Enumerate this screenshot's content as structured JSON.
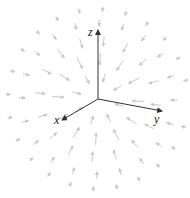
{
  "diagram": {
    "type": "3d-vector-field",
    "origin": [
      98,
      99
    ],
    "axes": {
      "z": {
        "label": "z",
        "end": [
          98,
          30
        ],
        "label_pos": [
          88,
          26
        ]
      },
      "y": {
        "label": "y",
        "end": [
          162,
          111
        ],
        "label_pos": [
          154,
          113
        ]
      },
      "x": {
        "label": "x",
        "end": [
          62,
          120
        ],
        "label_pos": [
          54,
          114
        ]
      }
    },
    "colors": {
      "axis": "#333333",
      "arrow": "#c8c8c8",
      "background": "#ffffff"
    },
    "rings": [
      {
        "radius": 22,
        "count": 8,
        "length": 9,
        "offset": 0.35
      },
      {
        "radius": 40,
        "count": 12,
        "length": 12,
        "offset": 0.1
      },
      {
        "radius": 58,
        "count": 16,
        "length": 10,
        "offset": 0.25
      },
      {
        "radius": 76,
        "count": 20,
        "length": 7,
        "offset": 0.05
      },
      {
        "radius": 90,
        "count": 24,
        "length": 5,
        "offset": 0.2
      }
    ]
  }
}
